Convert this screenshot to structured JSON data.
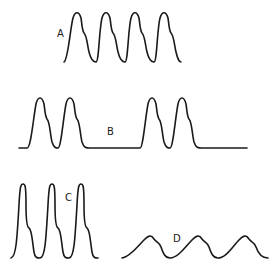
{
  "diagram": {
    "type": "waveform-comparison",
    "background": "#ffffff",
    "stroke_color": "#1a1a1a",
    "panels": [
      {
        "id": "A",
        "label": "A",
        "label_pos": [
          57,
          37
        ],
        "description": "four evenly spaced peaks with dicrotic shoulder, continuous oscillation",
        "peak_count": 4
      },
      {
        "id": "B",
        "label": "B",
        "label_pos": [
          107,
          135
        ],
        "description": "two pairs of peaks separated by a flat baseline",
        "peak_count": 4
      },
      {
        "id": "C",
        "label": "C",
        "label_pos": [
          65,
          201
        ],
        "description": "three tall narrow peaks with shoulder on descent",
        "peak_count": 3
      },
      {
        "id": "D",
        "label": "D",
        "label_pos": [
          173,
          242
        ],
        "description": "three low broad rounded peaks with shoulder",
        "peak_count": 3
      }
    ]
  }
}
